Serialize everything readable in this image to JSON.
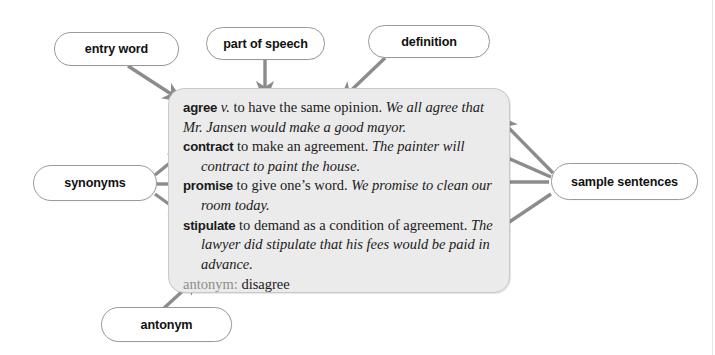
{
  "diagram": {
    "background_color": "#ffffff",
    "panel_fill": "#ebebeb",
    "panel_border": "#c9c9c9",
    "arrow_color": "#8c8c8c",
    "pill_border": "#9a9a9a",
    "antonym_label_color": "#8e8e8e"
  },
  "entry": {
    "senses": [
      {
        "headword": "agree",
        "pos": "v.",
        "definition": "to have the same opinion.",
        "example": "We all agree that Mr. Jansen would make a good mayor."
      },
      {
        "headword": "contract",
        "pos": "",
        "definition": "to make an agreement.",
        "example": "The painter will contract to paint the house."
      },
      {
        "headword": "promise",
        "pos": "",
        "definition": "to give one’s word.",
        "example": "We promise to clean our room today."
      },
      {
        "headword": "stipulate",
        "pos": "",
        "definition": "to demand as a condition of agreement.",
        "example": "The lawyer did stipulate that his fees would be paid in advance."
      }
    ],
    "antonym": {
      "label": "antonym:",
      "word": "disagree"
    }
  },
  "callouts": {
    "entry_word": "entry word",
    "part_of_speech": "part of speech",
    "definition": "definition",
    "synonyms": "synonyms",
    "sample_sentences": "sample sentences",
    "antonym": "antonym"
  }
}
